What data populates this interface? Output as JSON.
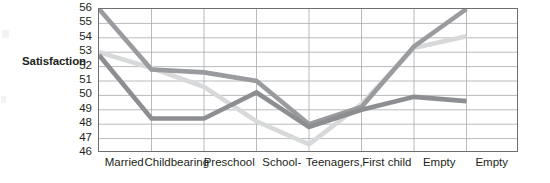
{
  "chart_data": {
    "type": "line",
    "title": "",
    "subtitle": "",
    "xlabel": "",
    "ylabel": "Satisfaction",
    "ylim": [
      46,
      56
    ],
    "ytick_labels": [
      "56",
      "55",
      "54",
      "53",
      "52",
      "51",
      "50",
      "49",
      "48",
      "47",
      "46"
    ],
    "ytick_values": [
      56,
      55,
      54,
      53,
      52,
      51,
      50,
      49,
      48,
      47,
      46
    ],
    "grid": true,
    "legend_position": "none",
    "categories": [
      "Married",
      "Childbearing",
      "Preschool",
      "School-",
      "Teenagers,",
      "First child",
      "Empty",
      "Empty"
    ],
    "series": [
      {
        "name": "series-1",
        "color": "#9a9b9e",
        "values": [
          56.0,
          51.8,
          51.6,
          51.0,
          48.0,
          49.2,
          53.4,
          56.0
        ]
      },
      {
        "name": "series-2",
        "color": "#8d8e91",
        "values": [
          52.8,
          48.4,
          48.4,
          50.2,
          47.8,
          49.0,
          49.9,
          49.6
        ]
      },
      {
        "name": "series-3",
        "color": "#d8d9da",
        "values": [
          53.0,
          51.9,
          50.6,
          48.2,
          46.6,
          49.4,
          53.3,
          54.1
        ]
      }
    ]
  },
  "axis": {
    "y_title": "Satisfaction"
  }
}
